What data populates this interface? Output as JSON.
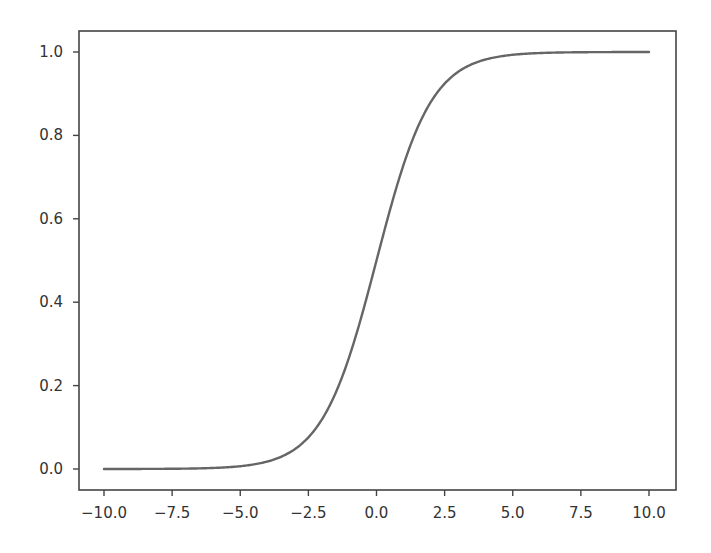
{
  "chart_data": {
    "type": "line",
    "title": "",
    "xlabel": "",
    "ylabel": "",
    "xlim": [
      -11.0,
      11.0
    ],
    "ylim": [
      -0.05,
      1.05
    ],
    "grid": false,
    "legend": null,
    "x_ticks": [
      -10.0,
      -7.5,
      -5.0,
      -2.5,
      0.0,
      2.5,
      5.0,
      7.5,
      10.0
    ],
    "x_tick_labels": [
      "−10.0",
      "−7.5",
      "−5.0",
      "−2.5",
      "0.0",
      "2.5",
      "5.0",
      "7.5",
      "10.0"
    ],
    "y_ticks": [
      0.0,
      0.2,
      0.4,
      0.6,
      0.8,
      1.0
    ],
    "y_tick_labels": [
      "0.0",
      "0.2",
      "0.4",
      "0.6",
      "0.8",
      "1.0"
    ],
    "series": [
      {
        "name": "sigmoid",
        "function": "1/(1+exp(-x))",
        "color": "#666666",
        "x": [
          -10,
          -9,
          -8,
          -7,
          -6,
          -5,
          -4,
          -3,
          -2.5,
          -2,
          -1.5,
          -1,
          -0.5,
          0,
          0.5,
          1,
          1.5,
          2,
          2.5,
          3,
          4,
          5,
          6,
          7,
          8,
          9,
          10
        ],
        "y": [
          0.0,
          0.0001,
          0.0003,
          0.0009,
          0.0025,
          0.0067,
          0.018,
          0.0474,
          0.0759,
          0.1192,
          0.1824,
          0.2689,
          0.3775,
          0.5,
          0.6225,
          0.7311,
          0.8176,
          0.8808,
          0.9241,
          0.9526,
          0.982,
          0.9933,
          0.9975,
          0.9991,
          0.9997,
          0.9999,
          1.0
        ]
      }
    ]
  },
  "colors": {
    "line": "#666666",
    "axes": "#444444",
    "text": "#333333",
    "background": "#ffffff"
  }
}
